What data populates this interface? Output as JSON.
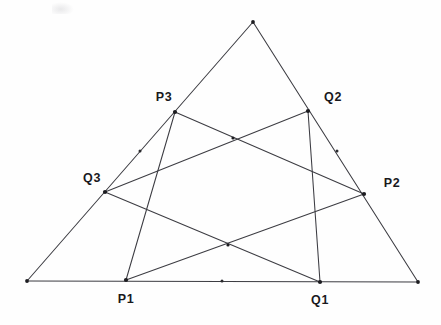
{
  "figure": {
    "background_color": "#fefefe",
    "line_color": "#3c3c42",
    "point_color": "#1c1c20",
    "label_color": "#19191d"
  },
  "labels": {
    "p1": "P1",
    "q1": "Q1",
    "p2": "P2",
    "q2": "Q2",
    "p3": "P3",
    "q3": "Q3"
  },
  "chart_data": {
    "type": "scatter",
    "xlabel": "",
    "ylabel": "",
    "xlim": [
      0,
      441
    ],
    "ylim": [
      325,
      0
    ],
    "grid": false,
    "legend": null,
    "points": [
      {
        "name": "A",
        "label": "",
        "x": 253,
        "y": 22,
        "kind": "triangle-apex",
        "marked": true
      },
      {
        "name": "B",
        "label": "",
        "x": 27,
        "y": 281,
        "kind": "triangle-vertex",
        "marked": true
      },
      {
        "name": "C",
        "label": "",
        "x": 418,
        "y": 282,
        "kind": "triangle-vertex",
        "marked": true
      },
      {
        "name": "P1",
        "label": "P1",
        "x": 126,
        "y": 280,
        "kind": "division-point",
        "marked": true,
        "label_x": 126,
        "label_y": 299
      },
      {
        "name": "Q1",
        "label": "Q1",
        "x": 320,
        "y": 282,
        "kind": "division-point",
        "marked": true,
        "label_x": 320,
        "label_y": 300
      },
      {
        "name": "P2",
        "label": "P2",
        "x": 364,
        "y": 194,
        "kind": "division-point",
        "marked": true,
        "label_x": 392,
        "label_y": 183
      },
      {
        "name": "Q2",
        "label": "Q2",
        "x": 308,
        "y": 111,
        "kind": "division-point",
        "marked": true,
        "label_x": 333,
        "label_y": 97
      },
      {
        "name": "P3",
        "label": "P3",
        "x": 175,
        "y": 112,
        "kind": "division-point",
        "marked": true,
        "label_x": 164,
        "label_y": 97
      },
      {
        "name": "Q3",
        "label": "Q3",
        "x": 105,
        "y": 192,
        "kind": "division-point",
        "marked": true,
        "label_x": 92,
        "label_y": 178
      },
      {
        "name": "mid-bottom-tick",
        "label": "",
        "x": 222,
        "y": 281,
        "kind": "tick",
        "marked": true
      },
      {
        "name": "left-edge-tick",
        "label": "",
        "x": 140,
        "y": 151,
        "kind": "tick",
        "marked": true
      },
      {
        "name": "right-edge-tick",
        "label": "",
        "x": 337,
        "y": 151,
        "kind": "tick",
        "marked": true
      },
      {
        "name": "upper-crossing",
        "label": "",
        "x": 233,
        "y": 138,
        "kind": "intersection",
        "marked": true
      },
      {
        "name": "lower-crossing",
        "label": "",
        "x": 228,
        "y": 245,
        "kind": "intersection",
        "marked": true
      }
    ],
    "segments": [
      {
        "name": "edge-AB",
        "from": "A",
        "to": "B",
        "x1": 253,
        "y1": 22,
        "x2": 27,
        "y2": 281,
        "role": "triangle-side"
      },
      {
        "name": "edge-AC",
        "from": "A",
        "to": "C",
        "x1": 253,
        "y1": 22,
        "x2": 418,
        "y2": 282,
        "role": "triangle-side"
      },
      {
        "name": "edge-BC",
        "from": "B",
        "to": "C",
        "x1": 27,
        "y1": 281,
        "x2": 418,
        "y2": 282,
        "role": "triangle-side"
      },
      {
        "name": "cevian-P3-P1",
        "from": "P3",
        "to": "P1",
        "x1": 175,
        "y1": 112,
        "x2": 126,
        "y2": 280,
        "role": "cevian"
      },
      {
        "name": "cevian-Q2-Q1",
        "from": "Q2",
        "to": "Q1",
        "x1": 308,
        "y1": 111,
        "x2": 320,
        "y2": 282,
        "role": "cevian"
      },
      {
        "name": "cevian-P3-P2",
        "from": "P3",
        "to": "P2",
        "x1": 175,
        "y1": 112,
        "x2": 364,
        "y2": 194,
        "role": "cevian"
      },
      {
        "name": "cevian-Q3-Q2",
        "from": "Q3",
        "to": "Q2",
        "x1": 105,
        "y1": 192,
        "x2": 308,
        "y2": 111,
        "role": "cevian"
      },
      {
        "name": "cevian-Q3-Q1",
        "from": "Q3",
        "to": "Q1",
        "x1": 105,
        "y1": 192,
        "x2": 320,
        "y2": 282,
        "role": "cevian"
      },
      {
        "name": "cevian-P1-P2",
        "from": "P1",
        "to": "P2",
        "x1": 126,
        "y1": 280,
        "x2": 364,
        "y2": 194,
        "role": "cevian"
      }
    ]
  }
}
